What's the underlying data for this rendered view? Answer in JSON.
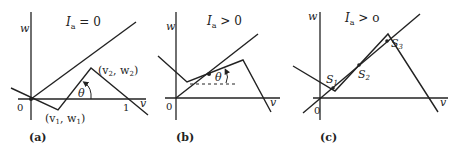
{
  "panels": [
    {
      "id": "a",
      "caption": "(a)",
      "condition": "I_a = 0",
      "condition_main": "I",
      "condition_sub": "a",
      "condition_rest": " = 0",
      "axis_x": "v",
      "axis_y": "w",
      "origin": "0",
      "tick_1": "1",
      "point1": "(v1, w1)",
      "point1_parts": {
        "open": "(v",
        "sub1": "1",
        "mid": ", w",
        "sub2": "1",
        "close": ")"
      },
      "point2": "(v2, w2)",
      "point2_parts": {
        "open": "(v",
        "sub1": "2",
        "mid": ", w",
        "sub2": "2",
        "close": ")"
      },
      "angle": "θ"
    },
    {
      "id": "b",
      "caption": "(b)",
      "condition": "I_a > 0",
      "condition_main": "I",
      "condition_sub": "a",
      "condition_rest": " > 0",
      "axis_x": "v",
      "axis_y": "w",
      "origin": "0",
      "angle": "θ"
    },
    {
      "id": "c",
      "caption": "(c)",
      "condition": "I_a > o",
      "condition_main": "I",
      "condition_sub": "a",
      "condition_rest": " > o",
      "axis_x": "v",
      "axis_y": "w",
      "origin": "0",
      "s1": "S",
      "s1_sub": "1",
      "s2": "S",
      "s2_sub": "2",
      "s3": "S",
      "s3_sub": "3"
    }
  ],
  "colors": {
    "stroke": "#222222",
    "background": "#ffffff"
  }
}
